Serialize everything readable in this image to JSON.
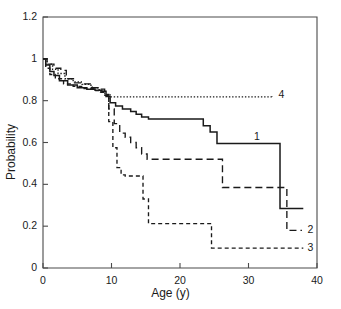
{
  "chart_data": {
    "type": "line",
    "title": "",
    "subtitle": "",
    "xlabel": "Age (y)",
    "ylabel": "Probability",
    "xlim": [
      0,
      40
    ],
    "ylim": [
      0,
      1.2
    ],
    "xticks": [
      "0",
      "10",
      "20",
      "30",
      "40"
    ],
    "xtick_values": [
      0,
      10,
      20,
      30,
      40
    ],
    "yticks": [
      "0",
      "0.2",
      "0.4",
      "0.6",
      "0.8",
      "1",
      "1.2"
    ],
    "ytick_values": [
      0,
      0.2,
      0.4,
      0.6,
      0.8,
      1,
      1.2
    ],
    "grid": false,
    "legend_position": "inline-right-end-of-curve",
    "annotations": [
      {
        "text": "1",
        "x": 30.8,
        "y": 0.625
      },
      {
        "text": "2",
        "x": 38.6,
        "y": 0.18
      },
      {
        "text": "3",
        "x": 38.6,
        "y": 0.095
      },
      {
        "text": "4",
        "x": 34.4,
        "y": 0.825
      }
    ],
    "series": [
      {
        "name": "1",
        "label": "1",
        "style": "solid",
        "color": "#1a1a1a",
        "step": "post",
        "x": [
          0,
          0.4,
          1.0,
          1.6,
          2.4,
          3.6,
          5.0,
          6.4,
          7.6,
          8.6,
          9.2,
          9.8,
          10.6,
          11.6,
          12.8,
          13.6,
          14.4,
          15.4,
          22.4,
          23.4,
          24.4,
          25.4,
          34.2,
          34.6,
          38.0
        ],
        "y": [
          1.0,
          0.97,
          0.94,
          0.92,
          0.895,
          0.875,
          0.862,
          0.855,
          0.85,
          0.845,
          0.82,
          0.79,
          0.775,
          0.76,
          0.748,
          0.735,
          0.722,
          0.712,
          0.712,
          0.68,
          0.65,
          0.595,
          0.595,
          0.285,
          0.285
        ]
      },
      {
        "name": "2",
        "label": "2",
        "style": "dashed",
        "color": "#1a1a1a",
        "step": "post",
        "x": [
          0,
          0.6,
          1.6,
          2.6,
          3.4,
          4.6,
          6.0,
          7.2,
          8.2,
          9.0,
          9.6,
          10.4,
          11.2,
          12.0,
          12.8,
          13.6,
          14.4,
          15.2,
          25.2,
          26.2,
          35.2,
          35.6,
          37.8
        ],
        "y": [
          1.0,
          0.975,
          0.955,
          0.945,
          0.905,
          0.885,
          0.88,
          0.862,
          0.855,
          0.83,
          0.76,
          0.69,
          0.645,
          0.625,
          0.6,
          0.575,
          0.545,
          0.52,
          0.52,
          0.385,
          0.385,
          0.18,
          0.18
        ]
      },
      {
        "name": "3",
        "label": "3",
        "style": "fine-dashed",
        "color": "#1a1a1a",
        "step": "post",
        "x": [
          0,
          0.4,
          1.0,
          1.8,
          3.0,
          4.4,
          6.0,
          7.4,
          8.4,
          9.0,
          9.6,
          10.2,
          10.8,
          11.4,
          12.0,
          13.8,
          14.6,
          15.4,
          23.8,
          24.6,
          38.0
        ],
        "y": [
          1.0,
          0.955,
          0.925,
          0.905,
          0.88,
          0.868,
          0.858,
          0.848,
          0.84,
          0.825,
          0.7,
          0.575,
          0.48,
          0.445,
          0.44,
          0.44,
          0.33,
          0.212,
          0.212,
          0.095,
          0.095
        ]
      },
      {
        "name": "4",
        "label": "4",
        "style": "dotted",
        "color": "#1a1a1a",
        "step": "post",
        "x": [
          0,
          0.6,
          1.4,
          2.2,
          3.2,
          4.4,
          5.6,
          7.0,
          8.2,
          9.0,
          9.8,
          33.4
        ],
        "y": [
          1.0,
          0.975,
          0.95,
          0.93,
          0.905,
          0.89,
          0.878,
          0.862,
          0.845,
          0.828,
          0.818,
          0.812
        ]
      }
    ]
  },
  "frame": {
    "axis_color": "#4a4a4a",
    "background": "#ffffff"
  }
}
